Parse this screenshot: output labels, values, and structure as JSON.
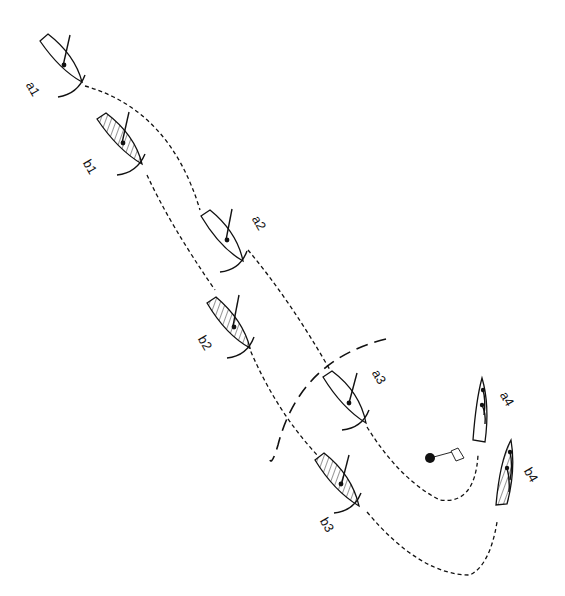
{
  "diagram": {
    "boats": [
      {
        "id": "a1",
        "label": "a1",
        "fleet": "a",
        "hatched": false
      },
      {
        "id": "b1",
        "label": "b1",
        "fleet": "b",
        "hatched": true
      },
      {
        "id": "a2",
        "label": "a2",
        "fleet": "a",
        "hatched": false
      },
      {
        "id": "b2",
        "label": "b2",
        "fleet": "b",
        "hatched": true
      },
      {
        "id": "a3",
        "label": "a3",
        "fleet": "a",
        "hatched": false
      },
      {
        "id": "b3",
        "label": "b3",
        "fleet": "b",
        "hatched": true
      },
      {
        "id": "a4",
        "label": "a4",
        "fleet": "a",
        "hatched": false
      },
      {
        "id": "b4",
        "label": "b4",
        "fleet": "b",
        "hatched": true
      }
    ],
    "mark": {
      "icon": "mark-buoy-with-flag-icon"
    },
    "zone": {
      "icon": "zone-circle-arc"
    },
    "colors": {
      "ink": "#111111",
      "background": "#ffffff"
    }
  }
}
